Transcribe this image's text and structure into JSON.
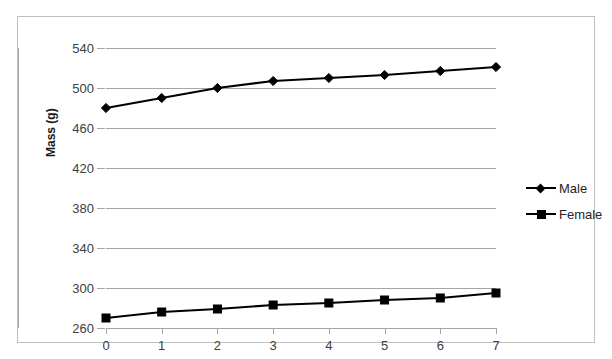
{
  "chart_data": {
    "type": "line",
    "title": "",
    "xlabel": "",
    "ylabel": "Mass (g)",
    "x": [
      0,
      1,
      2,
      3,
      4,
      5,
      6,
      7
    ],
    "xticklabels": [
      "0",
      "1",
      "2",
      "3",
      "4",
      "5",
      "6",
      "7"
    ],
    "yticks": [
      260,
      300,
      340,
      380,
      420,
      460,
      500,
      540
    ],
    "yticklabels": [
      "260",
      "300",
      "340",
      "380",
      "420",
      "460",
      "500",
      "540"
    ],
    "ylim": [
      260,
      540
    ],
    "xlim": [
      0,
      7
    ],
    "grid": "horizontal",
    "legend_position": "right",
    "series": [
      {
        "name": "Male",
        "marker": "diamond",
        "color": "#000000",
        "values": [
          480,
          490,
          500,
          507,
          510,
          513,
          517,
          521
        ]
      },
      {
        "name": "Female",
        "marker": "square",
        "color": "#000000",
        "values": [
          270,
          276,
          279,
          283,
          285,
          288,
          290,
          295
        ]
      }
    ]
  },
  "legend": {
    "items": [
      {
        "label": "Male",
        "marker": "diamond"
      },
      {
        "label": "Female",
        "marker": "square"
      }
    ]
  },
  "colors": {
    "series": "#000000",
    "gridline": "#a6a6a6",
    "border": "#bfbfbf",
    "tick_text": "#404040"
  }
}
